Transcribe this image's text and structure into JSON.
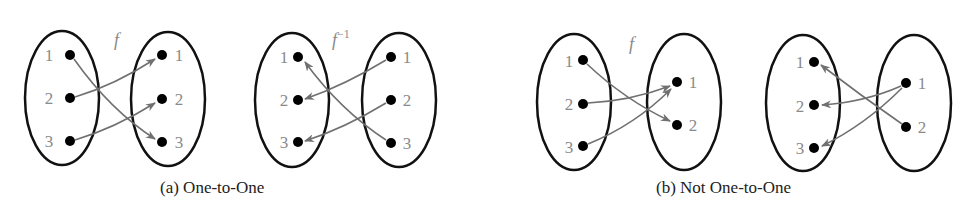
{
  "panels": [
    {
      "id": "a",
      "caption": "(a) One-to-One",
      "maps": [
        {
          "name": "f",
          "label": "f",
          "superscript": "",
          "domain": [
            "1",
            "2",
            "3"
          ],
          "codomain": [
            "1",
            "2",
            "3"
          ],
          "arrows": [
            [
              "1",
              "3"
            ],
            [
              "2",
              "1"
            ],
            [
              "3",
              "2"
            ]
          ]
        },
        {
          "name": "f-inverse",
          "label": "f",
          "superscript": "−1",
          "domain": [
            "1",
            "2",
            "3"
          ],
          "codomain": [
            "1",
            "2",
            "3"
          ],
          "arrows_direction": "right-to-left",
          "arrows": [
            [
              "3",
              "1"
            ],
            [
              "1",
              "2"
            ],
            [
              "2",
              "3"
            ]
          ]
        }
      ]
    },
    {
      "id": "b",
      "caption": "(b) Not One-to-One",
      "maps": [
        {
          "name": "f",
          "label": "f",
          "superscript": "",
          "domain": [
            "1",
            "2",
            "3"
          ],
          "codomain": [
            "1",
            "2"
          ],
          "arrows": [
            [
              "1",
              "2"
            ],
            [
              "2",
              "1"
            ],
            [
              "3",
              "1"
            ]
          ]
        },
        {
          "name": "inverse-attempt",
          "label": "",
          "superscript": "",
          "domain": [
            "1",
            "2",
            "3"
          ],
          "codomain": [
            "1",
            "2"
          ],
          "arrows_direction": "right-to-left",
          "arrows": [
            [
              "2",
              "1"
            ],
            [
              "1",
              "2"
            ],
            [
              "1",
              "3"
            ]
          ]
        }
      ]
    }
  ],
  "colors": {
    "ellipse": "#111111",
    "dot": "#000000",
    "arrow": "#707070",
    "label": "#8a8a8a",
    "caption": "#222222"
  }
}
